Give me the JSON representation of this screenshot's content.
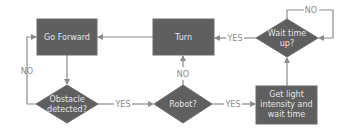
{
  "diagram": {
    "type": "flowchart",
    "nodes": {
      "go_forward": {
        "shape": "process",
        "lines": [
          "Go Forward"
        ]
      },
      "turn": {
        "shape": "process",
        "lines": [
          "Turn"
        ]
      },
      "wait_time_up": {
        "shape": "decision",
        "lines": [
          "Wait time",
          "up?"
        ]
      },
      "obstacle_detected": {
        "shape": "decision",
        "lines": [
          "Obstacle",
          "detected?"
        ]
      },
      "robot": {
        "shape": "decision",
        "lines": [
          "Robot?"
        ]
      },
      "get_light": {
        "shape": "process",
        "lines": [
          "Get light",
          "intensity and",
          "wait time"
        ]
      }
    },
    "edges": {
      "go_forward_to_obstacle": {
        "from": "go_forward",
        "to": "obstacle_detected",
        "label": ""
      },
      "obstacle_no": {
        "from": "obstacle_detected",
        "to": "go_forward",
        "label": "NO"
      },
      "obstacle_yes": {
        "from": "obstacle_detected",
        "to": "robot",
        "label": "YES"
      },
      "robot_no": {
        "from": "robot",
        "to": "turn",
        "label": "NO"
      },
      "robot_yes": {
        "from": "robot",
        "to": "get_light",
        "label": "YES"
      },
      "get_light_to_wait": {
        "from": "get_light",
        "to": "wait_time_up",
        "label": ""
      },
      "wait_yes": {
        "from": "wait_time_up",
        "to": "turn",
        "label": "YES"
      },
      "wait_no": {
        "from": "wait_time_up",
        "to": "wait_time_up",
        "label": "NO"
      },
      "turn_to_go_forward": {
        "from": "turn",
        "to": "go_forward",
        "label": ""
      }
    },
    "colors": {
      "node_fill": "#5f5f5f",
      "node_text": "#e4e4e4",
      "connector": "#8c8c8c",
      "label": "#8a8a8a"
    }
  }
}
